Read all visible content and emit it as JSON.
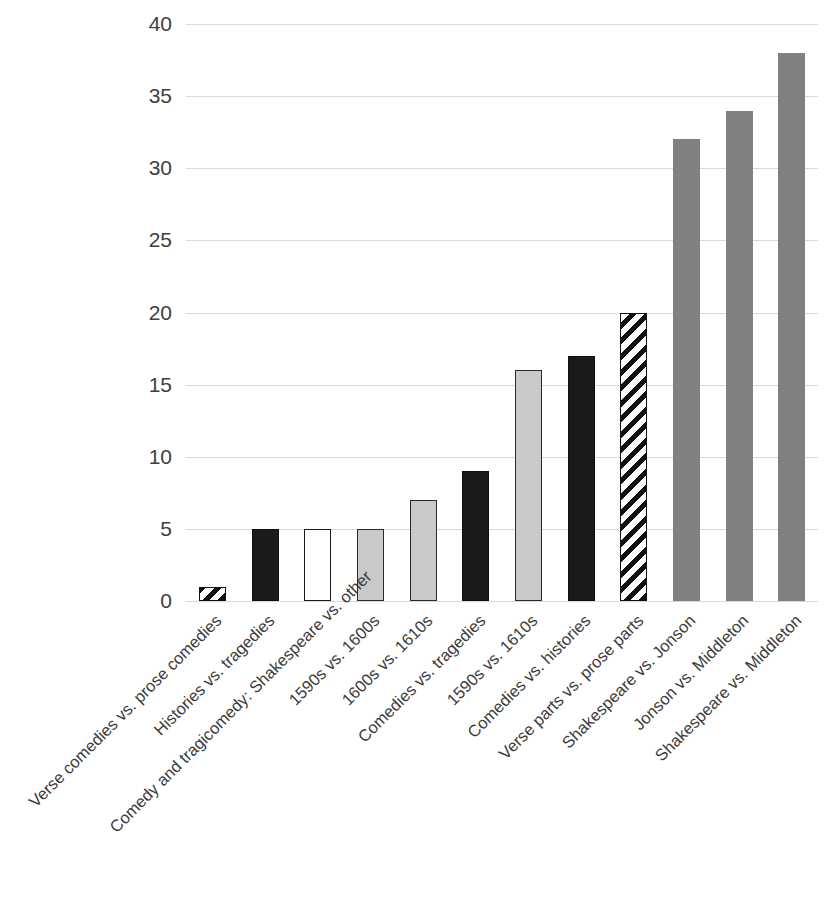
{
  "chart_data": {
    "type": "bar",
    "title": "",
    "subtitle": "",
    "xlabel": "",
    "ylabel": "",
    "ylim": [
      0,
      40
    ],
    "ytick_step": 5,
    "yticks": [
      40,
      35,
      30,
      25,
      20,
      15,
      10,
      5,
      0
    ],
    "grid": true,
    "legend": "none",
    "orientation": "vertical",
    "categories": [
      "Verse comedies vs. prose comedies",
      "Histories vs. tragedies",
      "Comedy and tragicomedy: Shakespeare vs. other",
      "1590s vs. 1600s",
      "1600s vs. 1610s",
      "Comedies vs. tragedies",
      "1590s vs. 1610s",
      "Comedies vs. histories",
      "Verse parts vs. prose parts",
      "Shakespeare vs. Jonson",
      "Jonson vs. Middleton",
      "Shakespeare vs. Middleton"
    ],
    "values": [
      1,
      5,
      5,
      5,
      7,
      9,
      16,
      17,
      20,
      32,
      34,
      38
    ],
    "bar_styles": [
      "hatch",
      "black",
      "white",
      "lightgray",
      "lightgray",
      "black",
      "lightgray",
      "black",
      "hatch",
      "midgray",
      "midgray",
      "midgray"
    ],
    "colors": {
      "black": "#1a1a1a",
      "white": "#ffffff",
      "lightgray": "#c9c9c9",
      "midgray": "#808080",
      "hatch_dark": "#111111",
      "hatch_light": "#ffffff",
      "gridline": "#d9d9d9",
      "text": "#404040",
      "background": "#ffffff"
    }
  }
}
